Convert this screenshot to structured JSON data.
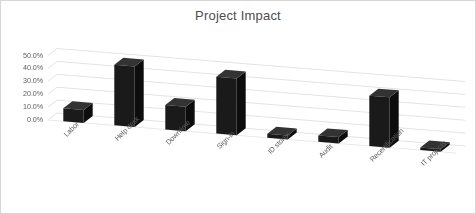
{
  "chart": {
    "title": "Project Impact",
    "border_color": "#d6d6d6",
    "background_color": "#ffffff",
    "bar_color": "#1a1a1a",
    "bar_side_color": "#0d0d0d",
    "bar_top_color": "#333333",
    "gridline_color": "#e3e3e3",
    "tick_text_color": "#5b5b5b",
    "title_color": "#4d4d4d"
  },
  "chart_data": {
    "type": "bar",
    "title": "Project Impact",
    "xlabel": "",
    "ylabel": "",
    "ylim": [
      0,
      50
    ],
    "ytick_labels": [
      "0.0%",
      "10.0%",
      "20.0%",
      "30.0%",
      "40.0%",
      "50.0%"
    ],
    "ytick_values": [
      0,
      10,
      20,
      30,
      40,
      50
    ],
    "grid": true,
    "legend": "none",
    "three_d": true,
    "categories": [
      "Labor",
      "Help desk",
      "Downtime",
      "Sign-in",
      "ID stores",
      "Audit",
      "Recertification",
      "IT projects"
    ],
    "values": [
      10,
      47,
      19,
      44,
      3,
      5,
      39,
      2
    ],
    "value_labels": [
      "10.0%",
      "47.0%",
      "19.0%",
      "44.0%",
      "3.0%",
      "5.0%",
      "39.0%",
      "2.0%"
    ]
  }
}
